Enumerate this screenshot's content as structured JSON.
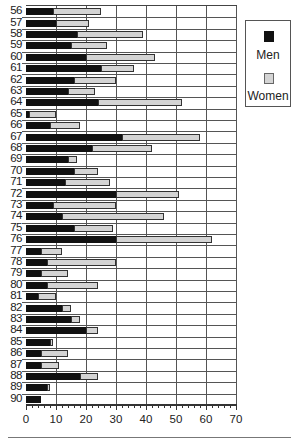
{
  "chart_data": {
    "type": "bar",
    "orientation": "horizontal",
    "stacked": true,
    "title": "",
    "xlabel": "",
    "ylabel": "",
    "xlim": [
      0,
      70
    ],
    "x_ticks": [
      "0",
      "10",
      "20",
      "30",
      "40",
      "50",
      "60",
      "70"
    ],
    "grid": true,
    "legend_position": "right-top",
    "categories": [
      "56",
      "57",
      "58",
      "59",
      "60",
      "61",
      "62",
      "63",
      "64",
      "65",
      "66",
      "67",
      "68",
      "69",
      "70",
      "71",
      "72",
      "73",
      "74",
      "75",
      "76",
      "77",
      "78",
      "79",
      "80",
      "81",
      "82",
      "83",
      "84",
      "85",
      "86",
      "87",
      "88",
      "89",
      "90"
    ],
    "series": [
      {
        "name": "Men",
        "color": "#111111",
        "values": [
          9,
          10,
          17,
          15,
          20,
          25,
          16,
          14,
          24,
          1,
          8,
          32,
          22,
          14,
          16,
          13,
          30,
          9,
          12,
          16,
          30,
          5,
          7,
          5,
          7,
          4,
          12,
          15,
          20,
          8,
          5,
          5,
          18,
          7,
          5
        ]
      },
      {
        "name": "Women",
        "color": "#d4d4d4",
        "values": [
          16,
          11,
          22,
          12,
          23,
          11,
          14,
          9,
          28,
          9,
          10,
          26,
          20,
          3,
          8,
          15,
          21,
          21,
          34,
          13,
          32,
          7,
          23,
          9,
          17,
          6,
          3,
          3,
          4,
          1,
          9,
          6,
          6,
          1,
          0
        ]
      }
    ]
  },
  "legend": {
    "items": [
      {
        "label": "Men",
        "color": "#111111"
      },
      {
        "label": "Women",
        "color": "#d4d4d4"
      }
    ]
  }
}
